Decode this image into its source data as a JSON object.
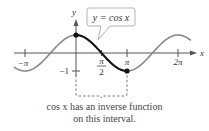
{
  "chart_data": {
    "type": "line",
    "title": "y = cos x",
    "function": "cos x",
    "xlabel": "x",
    "ylabel": "y",
    "x_ticks": [
      "-π",
      "π/2",
      "π",
      "2π"
    ],
    "y_ticks": [
      "-1"
    ],
    "highlighted_interval": [
      0,
      3.14159
    ],
    "highlighted_points": [
      {
        "x": 0,
        "y": 1
      },
      {
        "x": 3.14159,
        "y": -1
      }
    ],
    "xlim": [
      -3.6,
      5.6
    ],
    "ylim": [
      -1,
      1
    ]
  },
  "labels": {
    "y_axis": "y",
    "x_axis": "x",
    "neg_pi": "−π",
    "half_pi_num": "π",
    "half_pi_den": "2",
    "pi": "π",
    "two_pi": "2π",
    "neg_one": "−1",
    "callout": "y = cos x"
  },
  "caption": {
    "line1": "cos x has an inverse function",
    "line2": "on this interval."
  }
}
